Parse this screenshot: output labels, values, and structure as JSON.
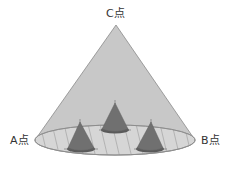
{
  "diagram": {
    "type": "cone-with-inner-cones",
    "labels": {
      "apex": "C点",
      "left_point": "A点",
      "right_point": "B点"
    },
    "colors": {
      "large_cone_fill": "#c8c8c8",
      "large_cone_stroke": "#8a8a8a",
      "base_fill": "#d6d6d6",
      "hatch": "#9a9a9a",
      "small_cone_fill": "#707070",
      "small_cone_base": "#5a5a5a",
      "label_text": "#333333"
    },
    "small_cones": [
      {
        "name": "center",
        "apex": [
          115,
          102
        ],
        "base_center": [
          115,
          130
        ]
      },
      {
        "name": "left",
        "apex": [
          80,
          121
        ],
        "base_center": [
          81,
          149
        ]
      },
      {
        "name": "right",
        "apex": [
          151,
          121
        ],
        "base_center": [
          150,
          149
        ]
      }
    ]
  }
}
